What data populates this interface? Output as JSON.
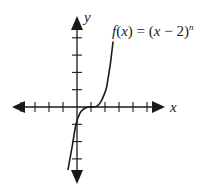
{
  "chart_data": {
    "type": "line",
    "title_parts": {
      "fname": "f",
      "lparen": "(",
      "var": "x",
      "rparen": ")",
      "eq": " = (",
      "var2": "x",
      "minus": " − 2)",
      "exp": "n"
    },
    "xlabel": "x",
    "ylabel": "y",
    "xlim": [
      -5,
      5
    ],
    "ylim": [
      -4,
      5
    ],
    "xticks": [
      -4,
      -3,
      -2,
      -1,
      1,
      2,
      3,
      4,
      5
    ],
    "yticks": [
      -3,
      -2,
      -1,
      1,
      2,
      3,
      4
    ],
    "tick_labels_shown": false,
    "grid": false,
    "axes_arrows": true,
    "series": [
      {
        "name": "f(x)",
        "x": [
          -0.64,
          -0.35,
          -0.07,
          0.21,
          0.5,
          0.8,
          1.1,
          1.43,
          1.7,
          1.93,
          2.1,
          2.2,
          2.4,
          2.57
        ],
        "y": [
          -3.6,
          -2.3,
          -1.0,
          -0.35,
          -0.1,
          0.0,
          0.0,
          0.05,
          0.3,
          0.7,
          1.1,
          1.55,
          2.6,
          3.75
        ]
      }
    ]
  }
}
